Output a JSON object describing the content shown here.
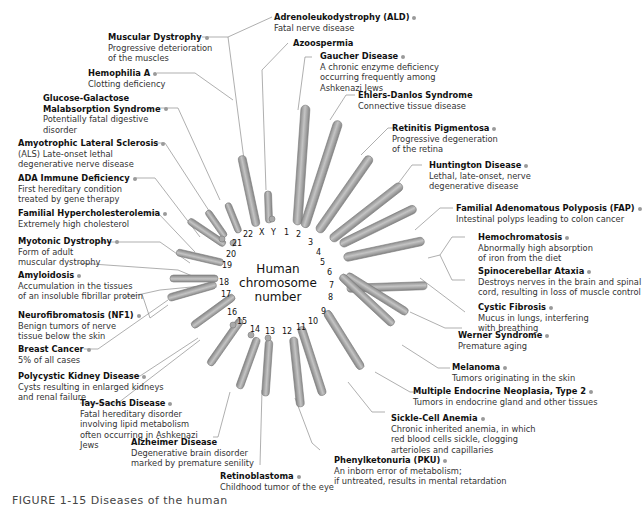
{
  "center": {
    "line1": "Human",
    "line2": "chromosome",
    "line3": "number"
  },
  "caption": "FIGURE 1-15 Diseases of the human",
  "colors": {
    "chromosome": "#a6a6a6",
    "chromosome_edge": "#7a7a7a",
    "leader_line": "#8c8c8c",
    "dot": "#9a9a9a",
    "text": "#222222"
  },
  "chromosome_numbers": [
    "1",
    "2",
    "3",
    "4",
    "5",
    "6",
    "7",
    "8",
    "9",
    "10",
    "11",
    "12",
    "13",
    "14",
    "15",
    "16",
    "17",
    "18",
    "19",
    "20",
    "21",
    "22",
    "X",
    "Y"
  ],
  "diseases": [
    {
      "id": "ald",
      "name": "Adrenoleukodystrophy (ALD)",
      "desc": [
        "Fatal nerve disease"
      ],
      "chromosome": "X"
    },
    {
      "id": "muscular-dystrophy",
      "name": "Muscular Dystrophy",
      "desc": [
        "Progressive deterioration",
        "of the muscles"
      ],
      "chromosome": "X"
    },
    {
      "id": "azoospermia",
      "name": "Azoospermia",
      "desc": [],
      "chromosome": "Y"
    },
    {
      "id": "hemophilia-a",
      "name": "Hemophilia A",
      "desc": [
        "Clotting deficiency"
      ],
      "chromosome": "X"
    },
    {
      "id": "gaucher",
      "name": "Gaucher Disease",
      "desc": [
        "A chronic enzyme deficiency",
        "occurring frequently among",
        "Ashkenazi Jews"
      ],
      "chromosome": "1"
    },
    {
      "id": "glucose-galactose",
      "name": "Glucose-Galactose",
      "name2": "Malabsorption Syndrome",
      "desc": [
        "Potentially fatal digestive",
        "disorder"
      ],
      "chromosome": "22"
    },
    {
      "id": "ehlers-danlos",
      "name": "Ehlers-Danlos Syndrome",
      "desc": [
        "Connective tissue disease"
      ],
      "chromosome": "2"
    },
    {
      "id": "retinitis",
      "name": "Retinitis Pigmentosa",
      "desc": [
        "Progressive degeneration",
        "of the retina"
      ],
      "chromosome": "3"
    },
    {
      "id": "als",
      "name": "Amyotrophic Lateral Sclerosis",
      "desc": [
        "(ALS)  Late-onset lethal",
        "degenerative nerve disease"
      ],
      "chromosome": "21"
    },
    {
      "id": "huntington",
      "name": "Huntington Disease",
      "desc": [
        "Lethal, late-onset, nerve",
        "degenerative disease"
      ],
      "chromosome": "4"
    },
    {
      "id": "ada",
      "name": "ADA Immune Deficiency",
      "desc": [
        "First hereditary condition",
        "treated by gene therapy"
      ],
      "chromosome": "20"
    },
    {
      "id": "fap",
      "name": "Familial Adenomatous Polyposis (FAP)",
      "desc": [
        "Intestinal polyps leading to colon cancer"
      ],
      "chromosome": "5"
    },
    {
      "id": "hypercholesterolemia",
      "name": "Familial Hypercholesterolemia",
      "desc": [
        "Extremely high cholesterol"
      ],
      "chromosome": "19"
    },
    {
      "id": "hemochromatosis",
      "name": "Hemochromatosis",
      "desc": [
        "Abnormally high absorption",
        "of iron from the diet"
      ],
      "chromosome": "6"
    },
    {
      "id": "myotonic",
      "name": "Myotonic Dystrophy",
      "desc": [
        "Form of adult",
        "muscular dystrophy"
      ],
      "chromosome": "19"
    },
    {
      "id": "spinocerebellar",
      "name": "Spinocerebellar Ataxia",
      "desc": [
        "Destroys nerves in the brain and spinal",
        "cord, resulting in loss of muscle control"
      ],
      "chromosome": "6"
    },
    {
      "id": "amyloidosis",
      "name": "Amyloidosis",
      "desc": [
        "Accumulation in the tissues",
        "of an insoluble fibrillar protein"
      ],
      "chromosome": "18"
    },
    {
      "id": "cystic-fibrosis",
      "name": "Cystic Fibrosis",
      "desc": [
        "Mucus in lungs, interfering",
        "with breathing"
      ],
      "chromosome": "7"
    },
    {
      "id": "nf1",
      "name": "Neurofibromatosis (NF1)",
      "desc": [
        "Benign tumors of nerve",
        "tissue below the skin"
      ],
      "chromosome": "17"
    },
    {
      "id": "werner",
      "name": "Werner Syndrome",
      "desc": [
        "Premature aging"
      ],
      "chromosome": "8"
    },
    {
      "id": "breast-cancer",
      "name": "Breast Cancer",
      "desc": [
        "5% of all cases"
      ],
      "chromosome": "17"
    },
    {
      "id": "melanoma",
      "name": "Melanoma",
      "desc": [
        "Tumors originating in the skin"
      ],
      "chromosome": "9"
    },
    {
      "id": "polycystic",
      "name": "Polycystic Kidney Disease",
      "desc": [
        "Cysts resulting in enlarged kidneys",
        "and renal failure"
      ],
      "chromosome": "16"
    },
    {
      "id": "men2",
      "name": "Multiple Endocrine Neoplasia, Type 2",
      "desc": [
        "Tumors in endocrine gland and other tissues"
      ],
      "chromosome": "10"
    },
    {
      "id": "tay-sachs",
      "name": "Tay-Sachs Disease",
      "desc": [
        "Fatal hereditary disorder",
        "involving lipid metabolism",
        "often occurring in Ashkenazi",
        "Jews"
      ],
      "chromosome": "15"
    },
    {
      "id": "sickle-cell",
      "name": "Sickle-Cell Anemia",
      "desc": [
        "Chronic inherited anemia, in which",
        "red blood cells sickle, clogging",
        "arterioles and capillaries"
      ],
      "chromosome": "11"
    },
    {
      "id": "alzheimer",
      "name": "Alzheimer Disease",
      "desc": [
        "Degenerative brain disorder",
        "marked by premature senility"
      ],
      "chromosome": "14"
    },
    {
      "id": "pku",
      "name": "Phenylketonuria (PKU)",
      "desc": [
        "An inborn error of metabolism;",
        "if untreated, results in mental retardation"
      ],
      "chromosome": "12"
    },
    {
      "id": "retinoblastoma",
      "name": "Retinoblastoma",
      "desc": [
        "Childhood tumor of the eye"
      ],
      "chromosome": "13"
    }
  ]
}
